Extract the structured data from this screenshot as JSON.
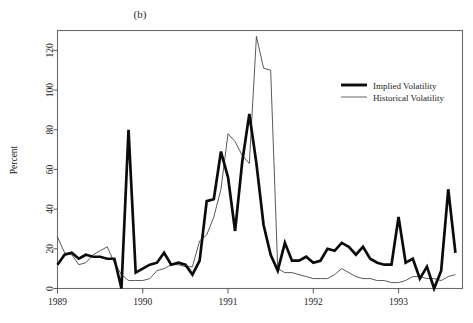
{
  "figure": {
    "panel_label": "(b)"
  },
  "legend": {
    "position": "top-right",
    "entries": [
      {
        "label": "Implied Volatility",
        "style": "thick-black-line",
        "color": "#0b0b0b"
      },
      {
        "label": "Historical Volatility",
        "style": "thin-grey-line",
        "color": "#3b3b3b"
      }
    ]
  },
  "chart_data": {
    "type": "line",
    "title": "(b)",
    "subtitle": "",
    "xlabel": "",
    "ylabel": "Percent",
    "xlim": [
      1989.0,
      1993.75
    ],
    "ylim": [
      0,
      130
    ],
    "yticks": [
      0,
      20,
      40,
      60,
      80,
      100,
      120
    ],
    "ytick_labels": [
      "0",
      "20",
      "40",
      "60",
      "80",
      "100",
      "120"
    ],
    "xticks": [
      1989,
      1990,
      1991,
      1992,
      1993
    ],
    "xtick_labels": [
      "1989",
      "1990",
      "1991",
      "1992",
      "1993"
    ],
    "grid": false,
    "legend_position": "top-right",
    "x": [
      1989.0,
      1989.083,
      1989.167,
      1989.25,
      1989.333,
      1989.417,
      1989.5,
      1989.583,
      1989.667,
      1989.75,
      1989.833,
      1989.917,
      1990.0,
      1990.083,
      1990.167,
      1990.25,
      1990.333,
      1990.417,
      1990.5,
      1990.583,
      1990.667,
      1990.75,
      1990.833,
      1990.917,
      1991.0,
      1991.083,
      1991.167,
      1991.25,
      1991.333,
      1991.417,
      1991.5,
      1991.583,
      1991.667,
      1991.75,
      1991.833,
      1991.917,
      1992.0,
      1992.083,
      1992.167,
      1992.25,
      1992.333,
      1992.417,
      1992.5,
      1992.583,
      1992.667,
      1992.75,
      1992.833,
      1992.917,
      1993.0,
      1993.083,
      1993.167,
      1993.25,
      1993.333,
      1993.417,
      1993.5,
      1993.583,
      1993.667
    ],
    "series": [
      {
        "name": "Implied Volatility",
        "color": "#0b0b0b",
        "linewidth": 2.7,
        "values": [
          12,
          17,
          18,
          15,
          17,
          16,
          16,
          15,
          15,
          0,
          80,
          8,
          10,
          12,
          13,
          18,
          12,
          13,
          12,
          7,
          14,
          44,
          45,
          69,
          56,
          29,
          64,
          88,
          63,
          32,
          17,
          9,
          23,
          14,
          14,
          16,
          13,
          14,
          20,
          19,
          23,
          21,
          17,
          21,
          15,
          13,
          12,
          12,
          36,
          13,
          15,
          5,
          11,
          0,
          9,
          50,
          18
        ]
      },
      {
        "name": "Historical Volatility",
        "color": "#3b3b3b",
        "linewidth": 0.85,
        "values": [
          26,
          18,
          17,
          12,
          13,
          17,
          19,
          21,
          13,
          7,
          4,
          4,
          4,
          5,
          9,
          10,
          12,
          12,
          11,
          11,
          24,
          27,
          36,
          50,
          78,
          74,
          67,
          63,
          127,
          111,
          110,
          10,
          8,
          8,
          7,
          6,
          5,
          5,
          5,
          7,
          10,
          8,
          6,
          5,
          5,
          4,
          4,
          3,
          3,
          4,
          6,
          6,
          5,
          5,
          4,
          6,
          7
        ]
      }
    ]
  }
}
